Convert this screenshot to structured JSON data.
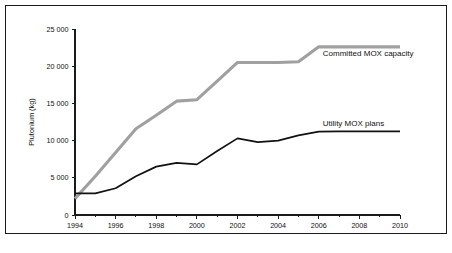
{
  "chart_data": {
    "type": "line",
    "title": "",
    "xlabel": "",
    "ylabel": "Plutonium (kg)",
    "xlim": [
      1994,
      2010
    ],
    "ylim": [
      0,
      25000
    ],
    "grid": false,
    "legend_position": "inline-right",
    "x": [
      1994,
      1995,
      1996,
      1997,
      1998,
      1999,
      2000,
      2001,
      2002,
      2003,
      2004,
      2005,
      2006,
      2007,
      2008,
      2009,
      2010
    ],
    "xticks": [
      1994,
      1996,
      1998,
      2000,
      2002,
      2004,
      2006,
      2008,
      2010
    ],
    "xticklabels": [
      "1994",
      "1996",
      "1998",
      "2000",
      "2002",
      "2004",
      "2006",
      "2008",
      "2010"
    ],
    "xminorticks": [
      1995,
      1997,
      1999,
      2001,
      2003,
      2005,
      2007,
      2009
    ],
    "yticks": [
      0,
      5000,
      10000,
      15000,
      20000,
      25000
    ],
    "yticklabels": [
      "0",
      "5 000",
      "10 000",
      "15 000",
      "20 000",
      "25 000"
    ],
    "series": [
      {
        "name": "Committed MOX capacity",
        "color": "#a0a0a0",
        "width": 3.1,
        "values": [
          2200,
          5200,
          8400,
          11600,
          13400,
          15300,
          15500,
          18000,
          20500,
          20500,
          20500,
          20600,
          22600,
          22600,
          22600,
          22600,
          22600
        ]
      },
      {
        "name": "Utility MOX plans",
        "color": "#111111",
        "width": 1.7,
        "values": [
          2900,
          2900,
          3600,
          5200,
          6500,
          7000,
          6800,
          8600,
          10300,
          9800,
          10000,
          10700,
          11200,
          11250,
          11250,
          11250,
          11250
        ]
      }
    ],
    "annotations": [
      {
        "text": "Committed MOX capacity",
        "x": 2006.2,
        "y": 21400
      },
      {
        "text": "Utility MOX plans",
        "x": 2006.2,
        "y": 11900
      }
    ]
  }
}
